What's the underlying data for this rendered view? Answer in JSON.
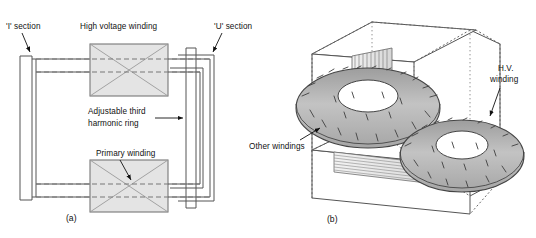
{
  "figure": {
    "panels": [
      {
        "id": "a",
        "caption": "(a)",
        "type": "schematic-plan-view",
        "labels": {
          "i_section": "'I' section",
          "hv_winding": "High voltage winding",
          "u_section": "'U' section",
          "third_harmonic_ring_line1": "Adjustable third",
          "third_harmonic_ring_line2": "harmonic ring",
          "primary_winding": "Primary winding"
        }
      },
      {
        "id": "b",
        "caption": "(b)",
        "type": "isometric-3d-view",
        "labels": {
          "hv_winding_line1": "H.V.",
          "hv_winding_line2": "winding",
          "other_windings": "Other windings"
        }
      }
    ],
    "colors": {
      "line": "#4a4a4a",
      "winding_fill": "#e4e4e4",
      "torus_fill": "#b8b8b8",
      "core_fill": "#ffffff",
      "text": "#111111",
      "background": "#ffffff"
    }
  }
}
